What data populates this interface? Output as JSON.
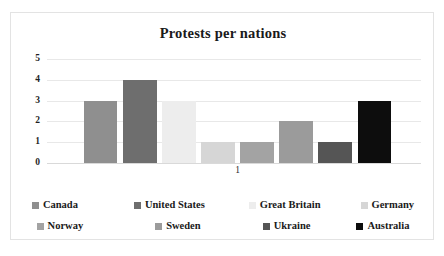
{
  "chart_data": {
    "type": "bar",
    "title": "Protests per nations",
    "xlabel": "",
    "ylabel": "",
    "categories": [
      "1"
    ],
    "ylim": [
      0,
      5
    ],
    "yticks": [
      0,
      1,
      2,
      3,
      4,
      5
    ],
    "grid": true,
    "legend_position": "bottom",
    "series": [
      {
        "name": "Canada",
        "values": [
          3
        ],
        "color": "#8f8f8f"
      },
      {
        "name": "United States",
        "values": [
          4
        ],
        "color": "#6e6e6e"
      },
      {
        "name": "Great Britain",
        "values": [
          3
        ],
        "color": "#ededed"
      },
      {
        "name": "Germany",
        "values": [
          1
        ],
        "color": "#d6d6d6"
      },
      {
        "name": "Norway",
        "values": [
          1
        ],
        "color": "#a3a3a3"
      },
      {
        "name": "Sweden",
        "values": [
          2
        ],
        "color": "#9b9b9b"
      },
      {
        "name": "Ukraine",
        "values": [
          1
        ],
        "color": "#555555"
      },
      {
        "name": "Australia",
        "values": [
          3
        ],
        "color": "#0d0d0d"
      }
    ]
  },
  "legend": {
    "rows": [
      [
        "Canada",
        "United States",
        "Great Britain",
        "Germany"
      ],
      [
        "Norway",
        "Sweden",
        "Ukraine",
        "Australia"
      ]
    ]
  }
}
